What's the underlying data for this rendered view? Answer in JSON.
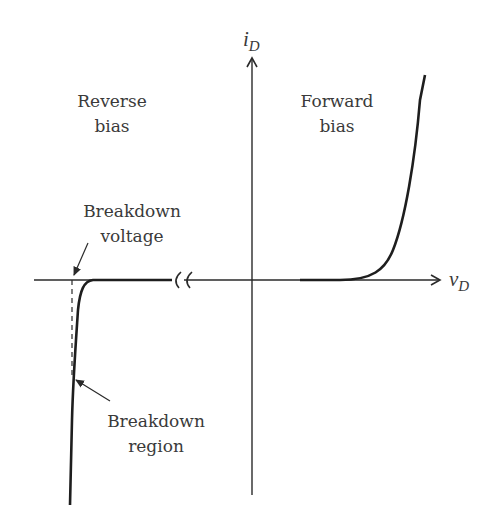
{
  "diagram": {
    "axes": {
      "y_label_main": "i",
      "y_label_sub": "D",
      "x_label_main": "v",
      "x_label_sub": "D"
    },
    "regions": {
      "reverse_line1": "Reverse",
      "reverse_line2": "bias",
      "forward_line1": "Forward",
      "forward_line2": "bias"
    },
    "annotations": {
      "breakdown_voltage_line1": "Breakdown",
      "breakdown_voltage_line2": "voltage",
      "breakdown_region_line1": "Breakdown",
      "breakdown_region_line2": "region"
    },
    "colors": {
      "line": "#2a2a2a",
      "text": "#3a3a3a",
      "background": "#ffffff"
    }
  }
}
